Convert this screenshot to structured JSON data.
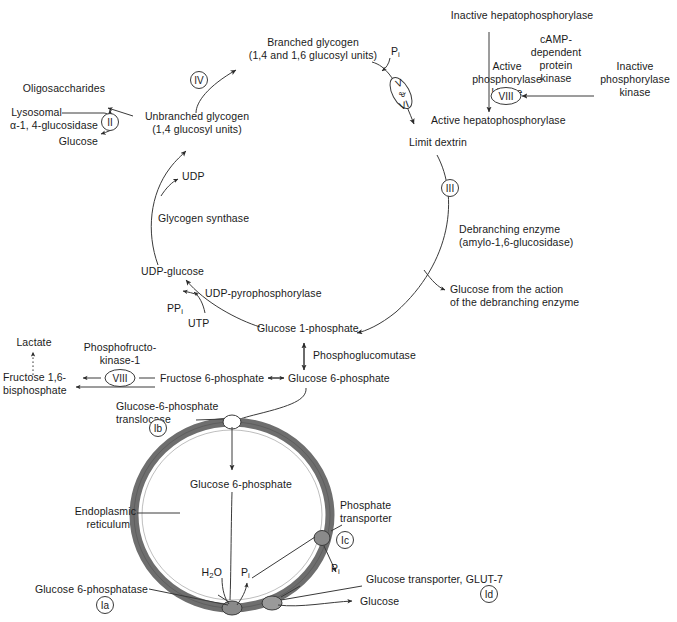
{
  "diagram": {
    "colors": {
      "stroke": "#3a3a3a",
      "text": "#1a1a1a",
      "membrane_outer": "#555555",
      "membrane_fill": "#6e6e6e",
      "background": "#ffffff"
    }
  },
  "glycogen_cycle": {
    "branched_glycogen_line1": "Branched glycogen",
    "branched_glycogen_line2": "(1,4 and 1,6 glucosyl units)",
    "unbranched_glycogen_line1": "Unbranched glycogen",
    "unbranched_glycogen_line2": "(1,4 glucosyl units)",
    "oligosaccharides": "Oligosaccharides",
    "lysosomal_line1": "Lysosomal",
    "lysosomal_line2": "α-1, 4-glucosidase",
    "glucose_lysosomal": "Glucose",
    "udp": "UDP",
    "glycogen_synthase": "Glycogen synthase",
    "udp_glucose": "UDP-glucose",
    "udp_pyrophosphorylase": "UDP-pyrophosphorylase",
    "ppi": "PP",
    "ppi_sub": "i",
    "utp": "UTP",
    "glucose_1_phosphate": "Glucose 1-phosphate",
    "limit_dextrin": "Limit dextrin",
    "pi_phosphorylase": "P",
    "pi_phosphorylase_sub": "i",
    "debranching_line1": "Debranching enzyme",
    "debranching_line2": "(amylo-1,6-glucosidase)",
    "glucose_debranching_line1": "Glucose from the action",
    "glucose_debranching_line2": "of the debranching enzyme"
  },
  "phosphorylase_cascade": {
    "inactive_hepatophosphorylase": "Inactive hepatophosphorylase",
    "active_hepatophosphorylase": "Active hepatophosphorylase",
    "active_phosphorylase_kinase_line1": "Active",
    "active_phosphorylase_kinase_line2": "phosphorylase",
    "active_phosphorylase_kinase_line3": "kinase",
    "inactive_phosphorylase_kinase_line1": "Inactive",
    "inactive_phosphorylase_kinase_line2": "phosphorylase",
    "inactive_phosphorylase_kinase_line3": "kinase",
    "camp_kinase_line1": "cAMP-",
    "camp_kinase_line2": "dependent",
    "camp_kinase_line3": "protein",
    "camp_kinase_line4": "kinase"
  },
  "glycolysis": {
    "lactate": "Lactate",
    "pfk_line1": "Phosphofructo-",
    "pfk_line2": "kinase-1",
    "fructose_16_bisphosphate_line1": "Fructose 1,6-",
    "fructose_16_bisphosphate_line2": "bisphosphate",
    "fructose_6_phosphate": "Fructose 6-phosphate",
    "glucose_6_phosphate": "Glucose 6-phosphate",
    "phosphoglucomutase": "Phosphoglucomutase"
  },
  "er_system": {
    "translocase_line1": "Glucose-6-phosphate",
    "translocase_line2": "translocase",
    "endoplasmic_reticulum_line1": "Endoplasmic",
    "endoplasmic_reticulum_line2": "reticulum",
    "lumen_glucose_6_phosphate": "Glucose 6-phosphate",
    "phosphate_transporter_line1": "Phosphate",
    "phosphate_transporter_line2": "transporter",
    "glucose_6_phosphatase": "Glucose 6-phosphatase",
    "glucose_transporter": "Glucose transporter, GLUT-7",
    "water": "H",
    "water_sub": "2",
    "water_end": "O",
    "pi_lumen": "P",
    "pi_lumen_sub": "i",
    "pi_cytosol": "P",
    "pi_cytosol_sub": "i",
    "glucose_out": "Glucose"
  },
  "enzyme_markers": [
    {
      "id": "marker-ii",
      "label": "II",
      "shape": "circle",
      "x": 110,
      "y": 122
    },
    {
      "id": "marker-iv",
      "label": "IV",
      "shape": "circle",
      "x": 199,
      "y": 80
    },
    {
      "id": "marker-v-vi",
      "label": "V & VI",
      "shape": "ellipse-tilt",
      "x": 401,
      "y": 93
    },
    {
      "id": "marker-viii-kinase",
      "label": "VIII",
      "shape": "ellipse",
      "x": 506,
      "y": 96
    },
    {
      "id": "marker-iii",
      "label": "III",
      "shape": "circle",
      "x": 450,
      "y": 188
    },
    {
      "id": "marker-viii-pfk",
      "label": "VIII",
      "shape": "ellipse",
      "x": 120,
      "y": 378
    },
    {
      "id": "marker-ib",
      "label": "Ib",
      "shape": "circle",
      "x": 158,
      "y": 428
    },
    {
      "id": "marker-ic",
      "label": "Ic",
      "shape": "circle",
      "x": 345,
      "y": 540
    },
    {
      "id": "marker-ia",
      "label": "Ia",
      "shape": "circle",
      "x": 105,
      "y": 605
    },
    {
      "id": "marker-id",
      "label": "Id",
      "shape": "circle",
      "x": 489,
      "y": 594
    }
  ]
}
